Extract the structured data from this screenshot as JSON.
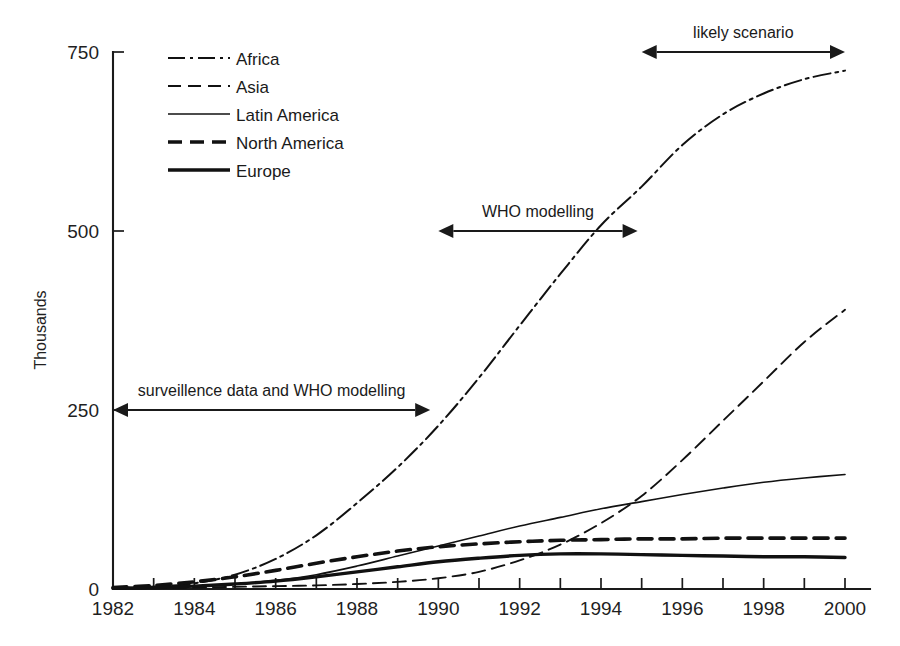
{
  "chart_data": {
    "type": "line",
    "title": "",
    "subtitle": "",
    "xlabel": "",
    "ylabel": "Thousands",
    "xlim": [
      1982,
      2000
    ],
    "ylim": [
      0,
      750
    ],
    "grid": false,
    "legend_position": "top-left",
    "x_tick_labels": [
      "1982",
      "1984",
      "1986",
      "1988",
      "1990",
      "1992",
      "1994",
      "1996",
      "1998",
      "2000"
    ],
    "x_tick_values": [
      1982,
      1984,
      1986,
      1988,
      1990,
      1992,
      1994,
      1996,
      1998,
      2000
    ],
    "x_minor_tick_values": [
      1983,
      1985,
      1987,
      1989,
      1991,
      1993,
      1995,
      1997,
      1999
    ],
    "y_tick_labels": [
      "0",
      "250",
      "500",
      "750"
    ],
    "y_tick_values": [
      0,
      250,
      500,
      750
    ],
    "x": [
      1982,
      1983,
      1984,
      1985,
      1986,
      1987,
      1988,
      1989,
      1990,
      1991,
      1992,
      1993,
      1994,
      1995,
      1996,
      1997,
      1998,
      1999,
      2000
    ],
    "series": [
      {
        "name": "Africa",
        "style": "dash-dot",
        "width": 2.0,
        "color": "#111111",
        "values": [
          1,
          3,
          8,
          20,
          42,
          75,
          120,
          170,
          228,
          295,
          368,
          440,
          508,
          562,
          620,
          663,
          692,
          712,
          724
        ]
      },
      {
        "name": "Asia",
        "style": "dashed",
        "width": 1.9,
        "color": "#111111",
        "values": [
          0,
          1,
          2,
          3,
          4,
          5,
          7,
          10,
          15,
          24,
          40,
          62,
          92,
          130,
          180,
          235,
          290,
          345,
          390
        ]
      },
      {
        "name": "Latin America",
        "style": "solid",
        "width": 1.6,
        "color": "#111111",
        "values": [
          1,
          2,
          4,
          7,
          12,
          20,
          32,
          46,
          60,
          74,
          88,
          100,
          112,
          122,
          132,
          141,
          149,
          155,
          160
        ]
      },
      {
        "name": "North America",
        "style": "dashed-thick",
        "width": 3.6,
        "color": "#111111",
        "values": [
          2,
          5,
          10,
          17,
          26,
          36,
          45,
          53,
          59,
          63,
          66,
          68,
          69,
          70,
          70,
          71,
          71,
          71,
          71
        ]
      },
      {
        "name": "Europe",
        "style": "solid-thick",
        "width": 3.4,
        "color": "#111111",
        "values": [
          1,
          2,
          4,
          7,
          11,
          17,
          24,
          31,
          38,
          43,
          47,
          49,
          49,
          48,
          47,
          46,
          45,
          45,
          44
        ]
      }
    ],
    "annotations": [
      {
        "id": "surveillence-span",
        "text": "surveillence data and WHO modelling",
        "x_start": 1982,
        "x_end": 1989.8,
        "y": 250
      },
      {
        "id": "who-modelling-span",
        "text": "WHO modelling",
        "x_start": 1990,
        "x_end": 1994.9,
        "y": 500
      },
      {
        "id": "likely-scenario-span",
        "text": "likely scenario",
        "x_start": 1995.0,
        "x_end": 2000,
        "y": 750
      }
    ]
  },
  "legend": {
    "entries": [
      {
        "label": "Africa",
        "style": "dash-dot"
      },
      {
        "label": "Asia",
        "style": "dashed"
      },
      {
        "label": "Latin America",
        "style": "solid"
      },
      {
        "label": "North America",
        "style": "dashed-thick"
      },
      {
        "label": "Europe",
        "style": "solid-thick"
      }
    ]
  }
}
